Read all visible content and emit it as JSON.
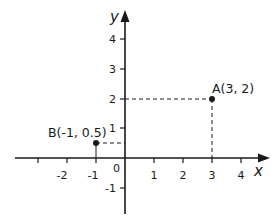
{
  "diagram": {
    "type": "cartesian-coordinate-plane",
    "axes": {
      "x_label": "x",
      "y_label": "y",
      "origin_label": "0",
      "x_ticks": [
        -3,
        -2,
        -1,
        1,
        2,
        3,
        4
      ],
      "x_tick_labels": [
        "",
        "-2",
        "-1",
        "1",
        "2",
        "3",
        "4"
      ],
      "y_ticks": [
        4,
        3,
        2,
        1,
        -1
      ],
      "y_tick_labels": [
        "4",
        "3",
        "2",
        "1",
        "-1"
      ]
    },
    "points": [
      {
        "name": "A",
        "x": 3,
        "y": 2,
        "label": "A(3, 2)"
      },
      {
        "name": "B",
        "x": -1,
        "y": 0.5,
        "label": "B(-1, 0.5)"
      }
    ],
    "guides": [
      {
        "from_point": "A",
        "to": "y-axis",
        "style": "dashed"
      },
      {
        "from_point": "A",
        "to": "x-axis",
        "style": "dashed"
      },
      {
        "from_point": "B",
        "to": "y-axis",
        "style": "dashed"
      },
      {
        "from_point": "B",
        "to": "x-axis",
        "style": "solid"
      }
    ],
    "colors": {
      "ink": "#1a1a1a",
      "background": "#ffffff"
    }
  }
}
